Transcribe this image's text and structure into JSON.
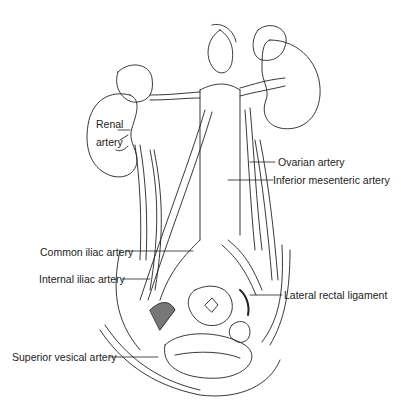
{
  "figure": {
    "labels": [
      {
        "id": "renal",
        "text": "Renal artery",
        "line1": "Renal",
        "line2": "artery"
      },
      {
        "id": "ovarian",
        "text": "Ovarian artery"
      },
      {
        "id": "ima",
        "text": "Inferior mesenteric artery"
      },
      {
        "id": "common-iliac",
        "text": "Common iliac artery"
      },
      {
        "id": "internal-iliac",
        "text": "Internal iliac artery"
      },
      {
        "id": "lateral-rectal",
        "text": "Lateral rectal ligament"
      },
      {
        "id": "superior-vesical",
        "text": "Superior vesical artery"
      }
    ]
  }
}
